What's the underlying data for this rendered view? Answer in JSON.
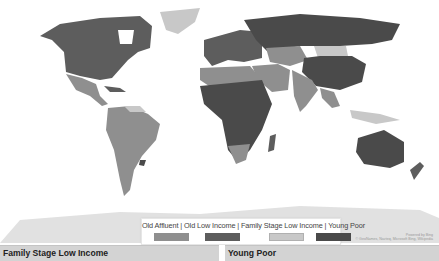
{
  "map": {
    "colors": {
      "old_affluent": "#8f8f8f",
      "old_low_income": "#5d5d5d",
      "family_stage_low_income": "#c8c8c8",
      "young_poor": "#4a4a4a",
      "ocean": "#ffffff"
    },
    "attribution": {
      "line1": "Powered by Bing",
      "line2": "© GeoNames, Navteq, Microsoft Bing, Wikipedia"
    }
  },
  "legend": {
    "labels_text": "Old Affluent  |  Old Low Income | Family Stage Low Income | Young Poor",
    "items": [
      {
        "label": "Old Affluent",
        "color": "#8f8f8f"
      },
      {
        "label": "Old Low Income",
        "color": "#5d5d5d"
      },
      {
        "label": "Family Stage Low Income",
        "color": "#c8c8c8"
      },
      {
        "label": "Young Poor",
        "color": "#4a4a4a"
      }
    ]
  },
  "panels": [
    {
      "title": "Family Stage Low Income"
    },
    {
      "title": "Young Poor"
    }
  ]
}
